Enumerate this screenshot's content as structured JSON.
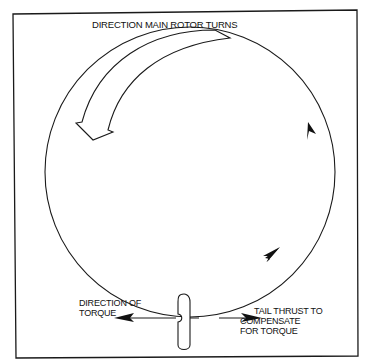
{
  "diagram": {
    "title": "DIRECTION MAIN ROTOR TURNS",
    "labels": {
      "direction_of_torque": [
        "DIRECTION OF",
        "TORQUE"
      ],
      "tail_thrust": [
        "TAIL THRUST TO",
        "COMPENSATE",
        "FOR TORQUE"
      ]
    },
    "elements": {
      "frame": "rectangular border",
      "main_rotor_circle": "circle with two arrowheads indicating counter-clockwise-from-viewer flow (upward on right side)",
      "large_curved_arrow": "hollow arrow along upper-left arc pointing down-left",
      "tail_rotor": "vertical elongated blade shape",
      "torque_arrow": "arrow pointing left",
      "thrust_arrow": "arrow pointing right"
    },
    "colors": {
      "line": "#1a1a1a",
      "background": "#ffffff"
    }
  }
}
